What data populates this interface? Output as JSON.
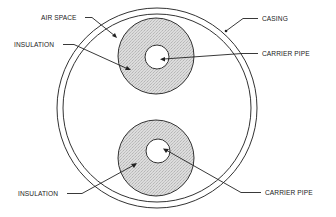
{
  "diagram": {
    "type": "cross-section",
    "colors": {
      "line": "#222222",
      "insulation_fill": "#d9d9d9",
      "background": "#ffffff"
    },
    "labels": {
      "air_space": "AIR SPACE",
      "casing": "CASING",
      "insulation_top": "INSULATION",
      "carrier_pipe_top": "CARRIER PIPE",
      "insulation_bottom": "INSULATION",
      "carrier_pipe_bottom": "CARRIER PIPE"
    },
    "components": [
      {
        "name": "casing",
        "shape": "double circle"
      },
      {
        "name": "air space",
        "shape": "region between casing and pipes"
      },
      {
        "name": "upper insulation",
        "shape": "annulus"
      },
      {
        "name": "upper carrier pipe",
        "shape": "circle"
      },
      {
        "name": "lower insulation",
        "shape": "annulus"
      },
      {
        "name": "lower carrier pipe",
        "shape": "circle"
      }
    ]
  }
}
